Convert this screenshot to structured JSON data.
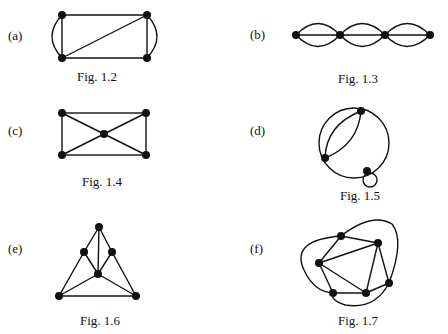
{
  "figures": [
    {
      "label": "(a)",
      "caption": "Fig. 1.2"
    },
    {
      "label": "(b)",
      "caption": "Fig. 1.3"
    },
    {
      "label": "(c)",
      "caption": "Fig. 1.4"
    },
    {
      "label": "(d)",
      "caption": "Fig. 1.5"
    },
    {
      "label": "(e)",
      "caption": "Fig. 1.6"
    },
    {
      "label": "(f)",
      "caption": "Fig. 1.7"
    }
  ],
  "colors": {
    "ink": "#111111",
    "background": "#ffffff"
  }
}
